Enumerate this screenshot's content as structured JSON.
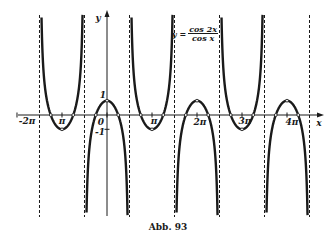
{
  "figure": {
    "caption": "Abb. 93",
    "formula": {
      "lhs": "y =",
      "numerator": "cos 2x",
      "denominator": "cos x"
    }
  },
  "chart_data": {
    "type": "line",
    "title": "",
    "function": "y = cos(2x) / cos(x)",
    "xlabel": "x",
    "ylabel": "y",
    "x_domain": [
      -4.7124,
      14.1372
    ],
    "ylim": [
      -7,
      7
    ],
    "grid": false,
    "legend": "none",
    "asymptotes_x": [
      -4.7124,
      -1.5708,
      1.5708,
      4.7124,
      7.854,
      10.9956,
      14.1372
    ],
    "asymptote_labels": [
      "-3π/2",
      "-π/2",
      "π/2",
      "3π/2",
      "5π/2",
      "7π/2",
      "9π/2"
    ],
    "x_tick_values": [
      -6.2832,
      -3.1416,
      0,
      3.1416,
      6.2832,
      9.4248,
      12.5664
    ],
    "x_tick_labels": [
      "-2π",
      "π",
      "0",
      "π",
      "2π",
      "3π",
      "4π"
    ],
    "y_tick_values": [
      1,
      -1
    ],
    "y_tick_labels": [
      "1",
      "-1"
    ],
    "extrema": [
      {
        "x": -3.1416,
        "y": -1
      },
      {
        "x": 0,
        "y": 1
      },
      {
        "x": 3.1416,
        "y": -1
      },
      {
        "x": 6.2832,
        "y": 1
      },
      {
        "x": 9.4248,
        "y": -1
      },
      {
        "x": 12.5664,
        "y": 1
      }
    ],
    "zeros_x": [
      -3.927,
      -2.3562,
      -0.7854,
      0.7854,
      2.3562,
      3.927,
      5.4978,
      7.0686,
      8.6394,
      10.2102,
      11.781,
      13.3518
    ],
    "sample_points": [
      {
        "x": -3.1416,
        "y": -1
      },
      {
        "x": -2.3562,
        "y": 0
      },
      {
        "x": -2.0,
        "y": 1.56
      },
      {
        "x": -0.7854,
        "y": 0
      },
      {
        "x": 0,
        "y": 1
      },
      {
        "x": 0.7854,
        "y": 0
      },
      {
        "x": 1.2,
        "y": -1.99
      },
      {
        "x": 3.1416,
        "y": -1
      },
      {
        "x": 6.2832,
        "y": 1
      },
      {
        "x": 9.4248,
        "y": -1
      },
      {
        "x": 12.5664,
        "y": 1
      }
    ]
  },
  "labels": {
    "x_axis": "x",
    "y_axis": "y",
    "x_ticks": [
      "-2π",
      "π",
      "0",
      "π",
      "2π",
      "3π",
      "4π"
    ],
    "y_one": "1",
    "y_minus_one": "-1"
  }
}
